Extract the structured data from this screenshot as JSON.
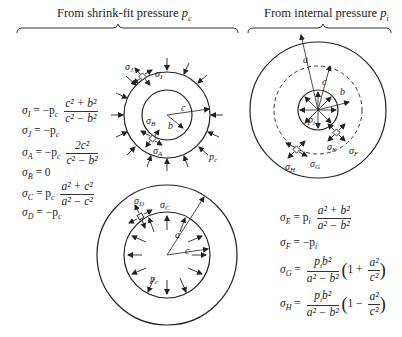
{
  "headers": {
    "left": "From shrink-fit pressure ",
    "left_var": "p",
    "left_sub": "c",
    "right": "From internal pressure ",
    "right_var": "p",
    "right_sub": "i"
  },
  "left_equations": [
    {
      "lhs": "σ",
      "lhs_sub": "I",
      "op": " = −p",
      "op_sub": "c",
      "num": "c² + b²",
      "den": "c² − b²"
    },
    {
      "lhs": "σ",
      "lhs_sub": "J",
      "rhs": " = −p",
      "rhs_sub": "c"
    },
    {
      "lhs": "σ",
      "lhs_sub": "A",
      "op": " = −p",
      "op_sub": "c",
      "num": "2c²",
      "den": "c² − b²"
    },
    {
      "lhs": "σ",
      "lhs_sub": "B",
      "rhs": " = 0"
    },
    {
      "lhs": "σ",
      "lhs_sub": "C",
      "op": " = p",
      "op_sub": "c",
      "num": "a² + c²",
      "den": "a² − c²"
    },
    {
      "lhs": "σ",
      "lhs_sub": "D",
      "rhs": " = −p",
      "rhs_sub": "c"
    }
  ],
  "right_equations": [
    {
      "lhs": "σ",
      "lhs_sub": "E",
      "op": " = p",
      "op_sub": "i",
      "num": "a² + b²",
      "den": "a² − b²"
    },
    {
      "lhs": "σ",
      "lhs_sub": "F",
      "rhs": " = −p",
      "rhs_sub": "i"
    },
    {
      "lhs": "σ",
      "lhs_sub": "G",
      "op": " = ",
      "num": "p",
      "num_sub": "i",
      "num_tail": "b²",
      "den": "a² − b²",
      "paren_sign": "1 + ",
      "pnum": "a²",
      "pden": "c²"
    },
    {
      "lhs": "σ",
      "lhs_sub": "H",
      "op": " = ",
      "num": "p",
      "num_sub": "i",
      "num_tail": "b²",
      "den": "a² − b²",
      "paren_sign": "1 − ",
      "pnum": "a²",
      "pden": "c²"
    }
  ],
  "figure_labels": {
    "sigma_I": "σI",
    "sigma_J": "σJ",
    "sigma_A": "σA",
    "sigma_B": "σB",
    "sigma_C": "σC",
    "sigma_D": "σD",
    "sigma_E": "σE",
    "sigma_F": "σF",
    "sigma_G": "σG",
    "sigma_H": "σH",
    "a": "a",
    "b": "b",
    "c": "c",
    "pc": "pc",
    "pi": "pi"
  }
}
